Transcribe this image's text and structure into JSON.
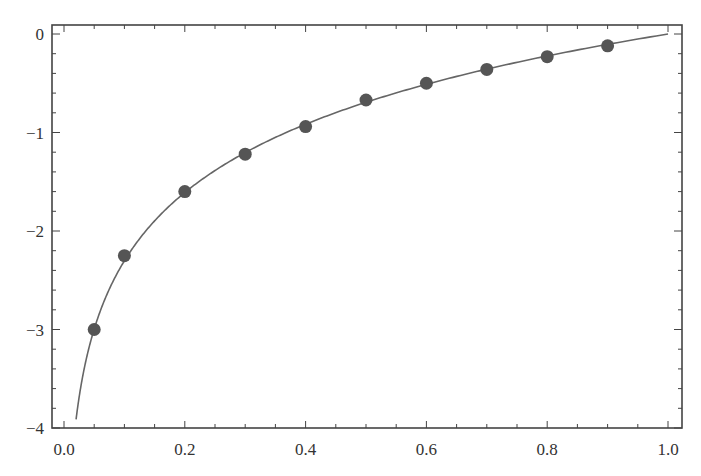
{
  "chart_data": {
    "type": "scatter",
    "title": "",
    "xlabel": "",
    "ylabel": "",
    "xlim": [
      0.0,
      1.0
    ],
    "ylim": [
      -4,
      0
    ],
    "grid": false,
    "legend": null,
    "x_ticks": [
      "0.0",
      "0.2",
      "0.4",
      "0.6",
      "0.8",
      "1.0"
    ],
    "y_ticks": [
      "0",
      "-1",
      "-2",
      "-3",
      "-4"
    ],
    "series": [
      {
        "name": "data points",
        "type": "scatter",
        "marker": "filled-circle",
        "color": "#555555",
        "x": [
          0.05,
          0.1,
          0.2,
          0.3,
          0.4,
          0.5,
          0.6,
          0.7,
          0.8,
          0.9
        ],
        "y": [
          -3.0,
          -2.25,
          -1.6,
          -1.22,
          -0.94,
          -0.67,
          -0.5,
          -0.36,
          -0.23,
          -0.12
        ]
      },
      {
        "name": "fit curve",
        "type": "line",
        "color": "#666666",
        "function": "ln(x)",
        "x_range": [
          0.02,
          1.0
        ]
      }
    ]
  }
}
